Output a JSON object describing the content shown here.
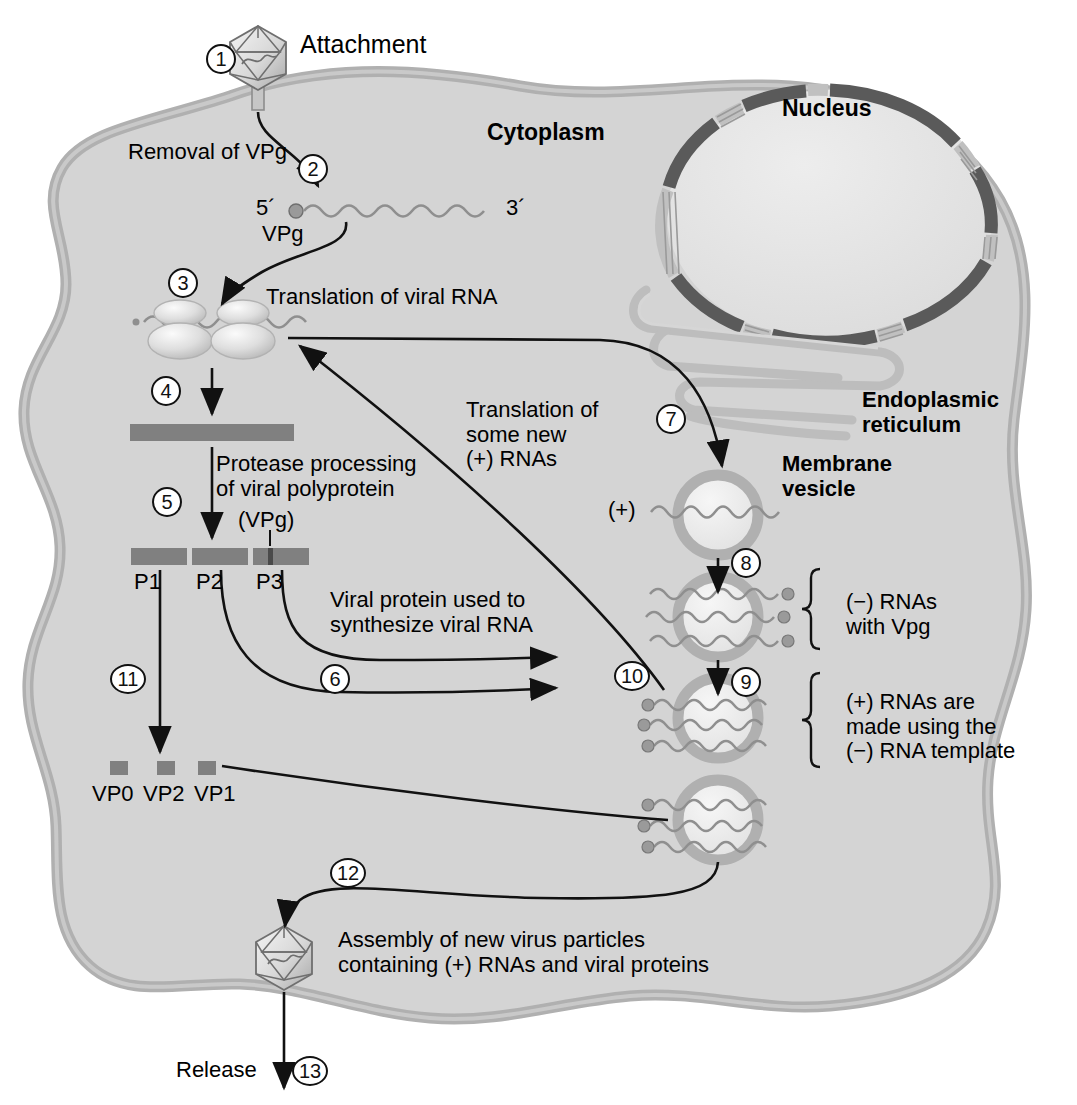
{
  "figure": {
    "type": "biological-process-diagram"
  },
  "colors": {
    "cell_cytoplasm": "#d4d4d4",
    "cell_membrane": "#b3b3b3",
    "nucleus_fill": "#e0e0e0",
    "nuclear_envelope": "#5a5a5a",
    "nuclear_pore": "#c9c9c9",
    "er_membrane": "#bdbdbd",
    "vesicle_membrane": "#b0b0b0",
    "vesicle_lumen": "#ececec",
    "protein_bar": "#808080",
    "rna_strand": "#8f8f8f",
    "arrow": "#111111",
    "text": "#000000",
    "page_background": "#ffffff"
  },
  "labels": {
    "attachment": "Attachment",
    "cytoplasm": "Cytoplasm",
    "nucleus": "Nucleus",
    "endoplasmic_reticulum": "Endoplasmic\nreticulum",
    "membrane_vesicle": "Membrane\nvesicle",
    "removal_of_vpg": "Removal of VPg",
    "five_prime": "5´",
    "three_prime": "3´",
    "vpg": "VPg",
    "translation_of_viral_rna": "Translation of viral RNA",
    "protease_processing": "Protease processing\nof viral polyprotein",
    "vpg_paren": "(VPg)",
    "p1": "P1",
    "p2": "P2",
    "p3": "P3",
    "viral_protein_used": "Viral protein used to\nsynthesize viral RNA",
    "translation_some_new": "Translation of\nsome new\n(+) RNAs",
    "vp0": "VP0",
    "vp2": "VP2",
    "vp1": "VP1",
    "plus_rna": "(+)",
    "minus_rnas_with_vpg": "(−) RNAs\nwith Vpg",
    "plus_rnas_made": "(+) RNAs are\nmade using the\n(−) RNA template",
    "assembly": "Assembly of new virus particles\ncontaining (+) RNAs and viral proteins",
    "release": "Release"
  },
  "steps": [
    {
      "n": "1",
      "name": "attachment"
    },
    {
      "n": "2",
      "name": "removal-of-vpg"
    },
    {
      "n": "3",
      "name": "translation-of-viral-rna"
    },
    {
      "n": "4",
      "name": "polyprotein-produced"
    },
    {
      "n": "5",
      "name": "protease-processing"
    },
    {
      "n": "6",
      "name": "viral-protein-to-rna-synthesis"
    },
    {
      "n": "7",
      "name": "rna-to-membrane-vesicle"
    },
    {
      "n": "8",
      "name": "minus-rna-synthesis"
    },
    {
      "n": "9",
      "name": "plus-rna-synthesis"
    },
    {
      "n": "10",
      "name": "new-plus-rna-to-translation"
    },
    {
      "n": "11",
      "name": "capsid-proteins-produced"
    },
    {
      "n": "12",
      "name": "virion-assembly"
    },
    {
      "n": "13",
      "name": "release"
    }
  ],
  "protein_bars": {
    "polyprotein": {
      "label": ""
    },
    "segments": [
      {
        "label": "P1"
      },
      {
        "label": "P2"
      },
      {
        "label": "P3"
      }
    ],
    "capsid_proteins": [
      {
        "label": "VP0"
      },
      {
        "label": "VP2"
      },
      {
        "label": "VP1"
      }
    ]
  },
  "brackets": [
    {
      "label": "(−) RNAs\nwith Vpg"
    },
    {
      "label": "(+) RNAs are\nmade using the\n(−) RNA template"
    }
  ]
}
